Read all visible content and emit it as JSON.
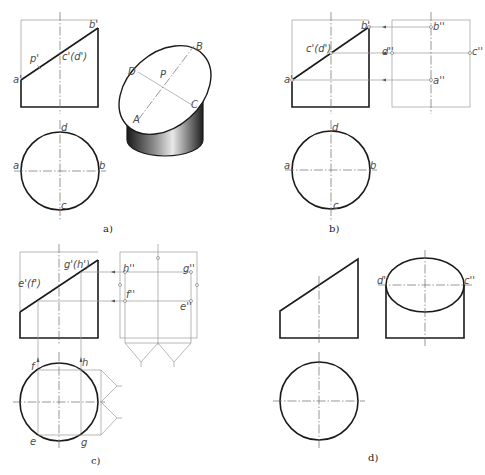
{
  "figure": {
    "panels": [
      {
        "id": "a",
        "caption": "a)",
        "caption_pos": [
          103,
          232
        ],
        "labels": [
          {
            "text": "b'",
            "x": 89,
            "y": 28
          },
          {
            "text": "p'",
            "x": 30,
            "y": 62
          },
          {
            "text": "c'(d')",
            "x": 62,
            "y": 60
          },
          {
            "text": "a'",
            "x": 13,
            "y": 83
          },
          {
            "text": "d",
            "x": 61,
            "y": 131
          },
          {
            "text": "a",
            "x": 13,
            "y": 169
          },
          {
            "text": "b",
            "x": 99,
            "y": 169
          },
          {
            "text": "c",
            "x": 61,
            "y": 209
          },
          {
            "text": "B",
            "x": 196,
            "y": 50
          },
          {
            "text": "D",
            "x": 128,
            "y": 75
          },
          {
            "text": "P",
            "x": 160,
            "y": 78
          },
          {
            "text": "C",
            "x": 191,
            "y": 108
          },
          {
            "text": "A",
            "x": 133,
            "y": 123
          }
        ]
      },
      {
        "id": "b",
        "caption": "b)",
        "caption_pos": [
          329,
          232
        ],
        "labels": [
          {
            "text": "b'",
            "x": 361,
            "y": 29
          },
          {
            "text": "c'(d')",
            "x": 306,
            "y": 52
          },
          {
            "text": "a'",
            "x": 284,
            "y": 83
          },
          {
            "text": "b''",
            "x": 433,
            "y": 30
          },
          {
            "text": "d''",
            "x": 382,
            "y": 55
          },
          {
            "text": "c''",
            "x": 472,
            "y": 55
          },
          {
            "text": "a''",
            "x": 433,
            "y": 84
          },
          {
            "text": "d",
            "x": 332,
            "y": 131
          },
          {
            "text": "a",
            "x": 284,
            "y": 169
          },
          {
            "text": "b",
            "x": 370,
            "y": 169
          },
          {
            "text": "c",
            "x": 333,
            "y": 209
          }
        ]
      },
      {
        "id": "c",
        "caption": "c)",
        "caption_pos": [
          91,
          464
        ],
        "labels": [
          {
            "text": "g'(h')",
            "x": 64,
            "y": 268
          },
          {
            "text": "e'(f')",
            "x": 18,
            "y": 287
          },
          {
            "text": "h''",
            "x": 123,
            "y": 272
          },
          {
            "text": "g''",
            "x": 183,
            "y": 272
          },
          {
            "text": "f''",
            "x": 126,
            "y": 298
          },
          {
            "text": "e''",
            "x": 180,
            "y": 310
          },
          {
            "text": "f",
            "x": 31,
            "y": 370
          },
          {
            "text": "h",
            "x": 82,
            "y": 366
          },
          {
            "text": "e",
            "x": 30,
            "y": 445
          },
          {
            "text": "g",
            "x": 81,
            "y": 446
          }
        ]
      },
      {
        "id": "d",
        "caption": "d)",
        "caption_pos": [
          368,
          461
        ],
        "labels": [
          {
            "text": "d''",
            "x": 377,
            "y": 284
          },
          {
            "text": "c''",
            "x": 464,
            "y": 284
          }
        ]
      }
    ]
  }
}
